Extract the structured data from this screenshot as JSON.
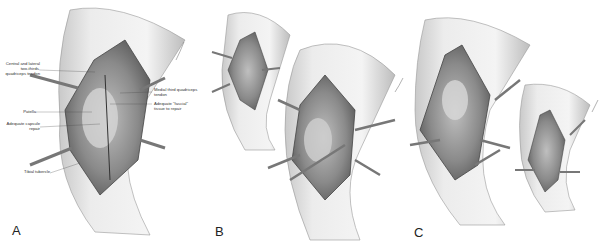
{
  "figure": {
    "panels": [
      {
        "letter": "A",
        "description": "Knee incision with medial and lateral retractors, labeled anatomy"
      },
      {
        "letter": "B",
        "description": "Two views of exposed knee joint with retractors"
      },
      {
        "letter": "C",
        "description": "Two views of exposed knee joint, flexed"
      }
    ],
    "panel_a_labels": {
      "central_lateral_tendon": "Central and lateral two-thirds, quadriceps tendon",
      "patella": "Patella",
      "capsule_repair": "Adequate capsule repair",
      "tibial_tubercle": "Tibial tubercle",
      "medial_third": "Medial third quadriceps tendon",
      "fascial_tissue": "Adequate \"fascial\" tissue to repair"
    }
  }
}
